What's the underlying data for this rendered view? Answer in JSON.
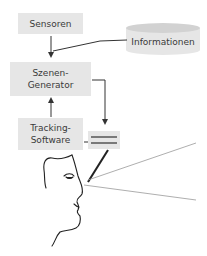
{
  "diagram": {
    "nodes": {
      "sensors": {
        "label": "Sensoren"
      },
      "information": {
        "label": "Informationen",
        "shape": "cylinder"
      },
      "scene_generator": {
        "line1": "Szenen-",
        "line2": "Generator"
      },
      "tracking_software": {
        "line1": "Tracking-",
        "line2": "Software"
      },
      "display": {
        "label": ""
      }
    },
    "edges": [
      {
        "from": "sensors",
        "to": "scene_generator"
      },
      {
        "from": "information",
        "to": "scene_generator"
      },
      {
        "from": "tracking_software",
        "to": "scene_generator"
      },
      {
        "from": "scene_generator",
        "to": "display"
      },
      {
        "from": "tracking_software",
        "to": "display"
      }
    ],
    "colors": {
      "box_fill": "#e6e6e6",
      "line": "#333333",
      "ray": "#999999",
      "text": "#3a3a3a"
    }
  }
}
